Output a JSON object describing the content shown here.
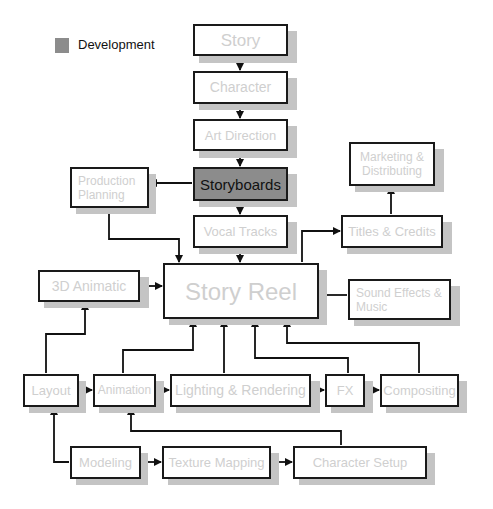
{
  "legend": {
    "label": "Development",
    "swatch_color": "#8c8c8c"
  },
  "colors": {
    "border": "#1a1a1a",
    "shadow": "#c4c4c4",
    "inactive_text": "#cfcfcf",
    "development_fill": "#8c8c8c",
    "development_text": "#111111"
  },
  "nodes": {
    "story": {
      "label": "Story"
    },
    "character": {
      "label": "Character"
    },
    "art_direction": {
      "label": "Art Direction"
    },
    "storyboards": {
      "label": "Storyboards",
      "category": "Development"
    },
    "production_planning": {
      "label": "Production Planning"
    },
    "vocal_tracks": {
      "label": "Vocal Tracks"
    },
    "marketing": {
      "label": "Marketing & Distributing"
    },
    "titles_credits": {
      "label": "Titles & Credits"
    },
    "animatic_3d": {
      "label": "3D Animatic"
    },
    "story_reel": {
      "label": "Story Reel"
    },
    "sound_effects": {
      "label": "Sound Effects & Music"
    },
    "layout": {
      "label": "Layout"
    },
    "animation": {
      "label": "Animation"
    },
    "lighting_rendering": {
      "label": "Lighting & Rendering"
    },
    "fx": {
      "label": "FX"
    },
    "compositing": {
      "label": "Compositing"
    },
    "modeling": {
      "label": "Modeling"
    },
    "texture_mapping": {
      "label": "Texture Mapping"
    },
    "character_setup": {
      "label": "Character Setup"
    }
  },
  "edges": [
    [
      "Story",
      "Character"
    ],
    [
      "Character",
      "Art Direction"
    ],
    [
      "Art Direction",
      "Storyboards"
    ],
    [
      "Storyboards",
      "Production Planning"
    ],
    [
      "Storyboards",
      "Vocal Tracks"
    ],
    [
      "Production Planning",
      "Story Reel"
    ],
    [
      "Vocal Tracks",
      "Story Reel"
    ],
    [
      "Story Reel",
      "Titles & Credits"
    ],
    [
      "Titles & Credits",
      "Marketing & Distributing"
    ],
    [
      "3D Animatic",
      "Story Reel"
    ],
    [
      "Sound Effects & Music",
      "Story Reel"
    ],
    [
      "Layout",
      "3D Animatic"
    ],
    [
      "Layout",
      "Animation"
    ],
    [
      "Animation",
      "Lighting & Rendering"
    ],
    [
      "Lighting & Rendering",
      "FX"
    ],
    [
      "FX",
      "Compositing"
    ],
    [
      "Animation",
      "Story Reel"
    ],
    [
      "Lighting & Rendering",
      "Story Reel"
    ],
    [
      "FX",
      "Story Reel"
    ],
    [
      "Compositing",
      "Story Reel"
    ],
    [
      "Modeling",
      "Layout"
    ],
    [
      "Modeling",
      "Texture Mapping"
    ],
    [
      "Texture Mapping",
      "Character Setup"
    ],
    [
      "Character Setup",
      "Animation"
    ]
  ]
}
